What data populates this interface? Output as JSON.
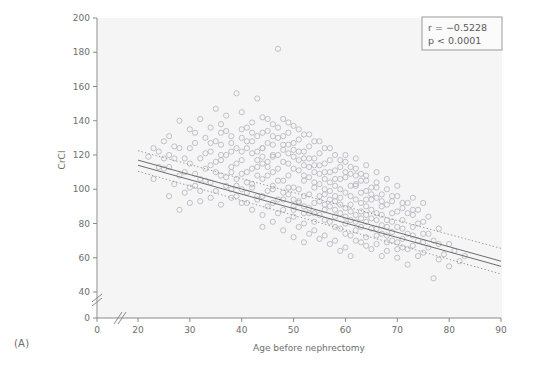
{
  "figure": {
    "panel_label": "(A)",
    "background_color": "#ffffff",
    "plot_background_color": "#f5f5f5",
    "axis_color": "#8a8a8a",
    "marker_color": "#b9b9c4",
    "line_color": "#6d6d6d",
    "band_color": "#9a9a9a"
  },
  "annotations": {
    "r_label": "r = −0.5228",
    "p_label": "p < 0.0001"
  },
  "chart_data": {
    "type": "scatter",
    "title": "",
    "xlabel": "Age before nephrectomy",
    "ylabel": "CrCl",
    "xlim": [
      17,
      90
    ],
    "ylim": [
      0,
      200
    ],
    "x_ticks": [
      0,
      20,
      30,
      40,
      50,
      60,
      70,
      80,
      90
    ],
    "y_ticks": [
      0,
      40,
      60,
      80,
      100,
      120,
      140,
      160,
      180,
      200
    ],
    "x_axis_break": true,
    "y_axis_break": true,
    "grid": false,
    "legend_position": "top-right",
    "correlation_r": -0.5228,
    "p_value": "< 0.0001",
    "regression": {
      "type": "linear",
      "x_start": 20,
      "x_end": 90,
      "y_start": 117.0,
      "y_end": 58.0,
      "second_line_offset": 3.0,
      "confidence_band": {
        "style": "dotted",
        "x_start": 20,
        "x_end": 90,
        "upper_start": 122.5,
        "upper_end": 65.5,
        "lower_start": 110.5,
        "lower_end": 50.5
      }
    },
    "points": [
      [
        22,
        119
      ],
      [
        23,
        106
      ],
      [
        24,
        122
      ],
      [
        25,
        128
      ],
      [
        25,
        112
      ],
      [
        26,
        96
      ],
      [
        26,
        131
      ],
      [
        27,
        118
      ],
      [
        27,
        103
      ],
      [
        28,
        124
      ],
      [
        28,
        140
      ],
      [
        29,
        110
      ],
      [
        29,
        98
      ],
      [
        30,
        135
      ],
      [
        30,
        115
      ],
      [
        30,
        101
      ],
      [
        31,
        127
      ],
      [
        31,
        109
      ],
      [
        32,
        141
      ],
      [
        32,
        118
      ],
      [
        32,
        93
      ],
      [
        33,
        130
      ],
      [
        33,
        112
      ],
      [
        34,
        122
      ],
      [
        34,
        104
      ],
      [
        34,
        136
      ],
      [
        35,
        147
      ],
      [
        35,
        116
      ],
      [
        35,
        99
      ],
      [
        36,
        126
      ],
      [
        36,
        108
      ],
      [
        36,
        138
      ],
      [
        37,
        120
      ],
      [
        37,
        102
      ],
      [
        37,
        143
      ],
      [
        38,
        131
      ],
      [
        38,
        113
      ],
      [
        38,
        95
      ],
      [
        39,
        156
      ],
      [
        39,
        124
      ],
      [
        39,
        106
      ],
      [
        40,
        135
      ],
      [
        40,
        117
      ],
      [
        40,
        100
      ],
      [
        40,
        145
      ],
      [
        41,
        128
      ],
      [
        41,
        110
      ],
      [
        41,
        92
      ],
      [
        42,
        139
      ],
      [
        42,
        121
      ],
      [
        42,
        103
      ],
      [
        43,
        153
      ],
      [
        43,
        131
      ],
      [
        43,
        113
      ],
      [
        43,
        96
      ],
      [
        44,
        124
      ],
      [
        44,
        106
      ],
      [
        44,
        142
      ],
      [
        45,
        134
      ],
      [
        45,
        116
      ],
      [
        45,
        99
      ],
      [
        45,
        127
      ],
      [
        46,
        120
      ],
      [
        46,
        102
      ],
      [
        46,
        138
      ],
      [
        47,
        182
      ],
      [
        47,
        130
      ],
      [
        47,
        112
      ],
      [
        47,
        94
      ],
      [
        48,
        123
      ],
      [
        48,
        105
      ],
      [
        48,
        141
      ],
      [
        49,
        133
      ],
      [
        49,
        115
      ],
      [
        49,
        97
      ],
      [
        49,
        126
      ],
      [
        50,
        119
      ],
      [
        50,
        101
      ],
      [
        50,
        137
      ],
      [
        50,
        88
      ],
      [
        51,
        129
      ],
      [
        51,
        111
      ],
      [
        51,
        93
      ],
      [
        51,
        122
      ],
      [
        52,
        132
      ],
      [
        52,
        114
      ],
      [
        52,
        96
      ],
      [
        52,
        105
      ],
      [
        53,
        125
      ],
      [
        53,
        107
      ],
      [
        53,
        89
      ],
      [
        53,
        118
      ],
      [
        54,
        128
      ],
      [
        54,
        110
      ],
      [
        54,
        92
      ],
      [
        54,
        101
      ],
      [
        55,
        121
      ],
      [
        55,
        103
      ],
      [
        55,
        85
      ],
      [
        55,
        114
      ],
      [
        56,
        124
      ],
      [
        56,
        106
      ],
      [
        56,
        88
      ],
      [
        56,
        97
      ],
      [
        57,
        117
      ],
      [
        57,
        99
      ],
      [
        57,
        81
      ],
      [
        57,
        110
      ],
      [
        58,
        120
      ],
      [
        58,
        102
      ],
      [
        58,
        84
      ],
      [
        58,
        93
      ],
      [
        59,
        113
      ],
      [
        59,
        95
      ],
      [
        59,
        77
      ],
      [
        59,
        106
      ],
      [
        60,
        116
      ],
      [
        60,
        98
      ],
      [
        60,
        80
      ],
      [
        60,
        89
      ],
      [
        60,
        107
      ],
      [
        61,
        109
      ],
      [
        61,
        91
      ],
      [
        61,
        73
      ],
      [
        61,
        102
      ],
      [
        62,
        112
      ],
      [
        62,
        94
      ],
      [
        62,
        76
      ],
      [
        62,
        85
      ],
      [
        62,
        103
      ],
      [
        63,
        105
      ],
      [
        63,
        87
      ],
      [
        63,
        69
      ],
      [
        63,
        98
      ],
      [
        64,
        108
      ],
      [
        64,
        90
      ],
      [
        64,
        72
      ],
      [
        64,
        81
      ],
      [
        64,
        99
      ],
      [
        65,
        101
      ],
      [
        65,
        83
      ],
      [
        65,
        65
      ],
      [
        65,
        94
      ],
      [
        66,
        104
      ],
      [
        66,
        86
      ],
      [
        66,
        68
      ],
      [
        66,
        77
      ],
      [
        67,
        97
      ],
      [
        67,
        79
      ],
      [
        67,
        61
      ],
      [
        67,
        90
      ],
      [
        68,
        100
      ],
      [
        68,
        82
      ],
      [
        68,
        64
      ],
      [
        68,
        73
      ],
      [
        69,
        93
      ],
      [
        69,
        75
      ],
      [
        69,
        86
      ],
      [
        70,
        96
      ],
      [
        70,
        78
      ],
      [
        70,
        60
      ],
      [
        70,
        69
      ],
      [
        71,
        89
      ],
      [
        71,
        71
      ],
      [
        71,
        82
      ],
      [
        72,
        92
      ],
      [
        72,
        74
      ],
      [
        72,
        56
      ],
      [
        72,
        65
      ],
      [
        73,
        85
      ],
      [
        73,
        67
      ],
      [
        73,
        78
      ],
      [
        74,
        88
      ],
      [
        74,
        70
      ],
      [
        74,
        61
      ],
      [
        75,
        81
      ],
      [
        75,
        63
      ],
      [
        75,
        74
      ],
      [
        76,
        84
      ],
      [
        76,
        66
      ],
      [
        77,
        48
      ],
      [
        77,
        70
      ],
      [
        78,
        77
      ],
      [
        78,
        59
      ],
      [
        79,
        62
      ],
      [
        80,
        68
      ],
      [
        80,
        55
      ],
      [
        81,
        64
      ],
      [
        82,
        58
      ],
      [
        83,
        61
      ],
      [
        24,
        113
      ],
      [
        26,
        120
      ],
      [
        28,
        108
      ],
      [
        31,
        133
      ],
      [
        33,
        121
      ],
      [
        35,
        128
      ],
      [
        37,
        134
      ],
      [
        39,
        115
      ],
      [
        41,
        136
      ],
      [
        43,
        122
      ],
      [
        45,
        108
      ],
      [
        47,
        120
      ],
      [
        49,
        108
      ],
      [
        51,
        100
      ],
      [
        53,
        97
      ],
      [
        55,
        93
      ],
      [
        57,
        90
      ],
      [
        59,
        86
      ],
      [
        61,
        82
      ],
      [
        63,
        78
      ],
      [
        30,
        124
      ],
      [
        32,
        106
      ],
      [
        34,
        114
      ],
      [
        36,
        117
      ],
      [
        38,
        122
      ],
      [
        40,
        109
      ],
      [
        42,
        112
      ],
      [
        44,
        115
      ],
      [
        46,
        110
      ],
      [
        48,
        98
      ],
      [
        50,
        94
      ],
      [
        52,
        90
      ],
      [
        54,
        86
      ],
      [
        56,
        82
      ],
      [
        58,
        78
      ],
      [
        60,
        74
      ],
      [
        62,
        70
      ],
      [
        64,
        67
      ],
      [
        66,
        95
      ],
      [
        68,
        91
      ],
      [
        70,
        87
      ],
      [
        42,
        128
      ],
      [
        44,
        96
      ],
      [
        46,
        92
      ],
      [
        48,
        88
      ],
      [
        50,
        84
      ],
      [
        52,
        80
      ],
      [
        54,
        76
      ],
      [
        56,
        73
      ],
      [
        58,
        70
      ],
      [
        60,
        66
      ],
      [
        44,
        133
      ],
      [
        46,
        126
      ],
      [
        48,
        131
      ],
      [
        50,
        127
      ],
      [
        52,
        122
      ],
      [
        54,
        118
      ],
      [
        56,
        115
      ],
      [
        58,
        111
      ],
      [
        60,
        120
      ],
      [
        62,
        118
      ],
      [
        64,
        114
      ],
      [
        66,
        110
      ],
      [
        38,
        100
      ],
      [
        40,
        92
      ],
      [
        42,
        88
      ],
      [
        44,
        85
      ],
      [
        36,
        91
      ],
      [
        34,
        95
      ],
      [
        32,
        99
      ],
      [
        30,
        92
      ],
      [
        28,
        88
      ],
      [
        26,
        113
      ],
      [
        66,
        101
      ],
      [
        68,
        106
      ],
      [
        70,
        102
      ],
      [
        64,
        105
      ],
      [
        62,
        108
      ],
      [
        59,
        117
      ],
      [
        61,
        113
      ],
      [
        63,
        109
      ],
      [
        57,
        124
      ],
      [
        55,
        128
      ],
      [
        53,
        132
      ],
      [
        51,
        135
      ],
      [
        49,
        139
      ],
      [
        47,
        136
      ],
      [
        45,
        141
      ],
      [
        52,
        108
      ],
      [
        54,
        104
      ],
      [
        56,
        100
      ],
      [
        58,
        96
      ],
      [
        50,
        112
      ],
      [
        48,
        116
      ],
      [
        46,
        119
      ],
      [
        44,
        124
      ],
      [
        65,
        77
      ],
      [
        67,
        85
      ],
      [
        69,
        81
      ],
      [
        71,
        77
      ],
      [
        73,
        73
      ],
      [
        75,
        69
      ],
      [
        59,
        64
      ],
      [
        61,
        61
      ],
      [
        57,
        68
      ],
      [
        55,
        71
      ],
      [
        53,
        74
      ],
      [
        51,
        78
      ],
      [
        49,
        82
      ],
      [
        47,
        86
      ],
      [
        45,
        90
      ],
      [
        43,
        94
      ],
      [
        41,
        98
      ],
      [
        39,
        102
      ],
      [
        37,
        107
      ],
      [
        35,
        110
      ],
      [
        33,
        105
      ],
      [
        31,
        102
      ],
      [
        29,
        118
      ],
      [
        27,
        125
      ],
      [
        25,
        118
      ],
      [
        23,
        124
      ],
      [
        63,
        92
      ],
      [
        65,
        88
      ],
      [
        67,
        93
      ],
      [
        69,
        96
      ],
      [
        71,
        92
      ],
      [
        73,
        88
      ],
      [
        61,
        96
      ],
      [
        59,
        100
      ],
      [
        57,
        104
      ],
      [
        55,
        109
      ],
      [
        53,
        113
      ],
      [
        51,
        117
      ],
      [
        49,
        121
      ],
      [
        43,
        108
      ],
      [
        41,
        104
      ],
      [
        39,
        96
      ],
      [
        42,
        101
      ],
      [
        40,
        122
      ],
      [
        38,
        127
      ],
      [
        36,
        133
      ],
      [
        34,
        127
      ],
      [
        46,
        100
      ],
      [
        48,
        94
      ],
      [
        50,
        90
      ],
      [
        52,
        86
      ],
      [
        54,
        81
      ],
      [
        56,
        91
      ],
      [
        58,
        88
      ],
      [
        60,
        84
      ],
      [
        62,
        81
      ],
      [
        64,
        94
      ],
      [
        66,
        73
      ],
      [
        68,
        69
      ],
      [
        70,
        65
      ],
      [
        72,
        86
      ],
      [
        74,
        80
      ],
      [
        76,
        74
      ],
      [
        78,
        68
      ],
      [
        44,
        78
      ],
      [
        46,
        81
      ],
      [
        48,
        76
      ],
      [
        50,
        72
      ],
      [
        52,
        69
      ],
      [
        47,
        105
      ],
      [
        45,
        113
      ],
      [
        43,
        117
      ],
      [
        41,
        124
      ],
      [
        49,
        101
      ],
      [
        51,
        92
      ],
      [
        53,
        86
      ],
      [
        55,
        96
      ],
      [
        57,
        94
      ],
      [
        59,
        91
      ],
      [
        61,
        87
      ],
      [
        63,
        83
      ],
      [
        65,
        97
      ],
      [
        67,
        74
      ],
      [
        69,
        70
      ],
      [
        71,
        66
      ],
      [
        73,
        95
      ],
      [
        75,
        92
      ],
      [
        36,
        120
      ],
      [
        38,
        110
      ],
      [
        40,
        130
      ],
      [
        42,
        133
      ],
      [
        60,
        110
      ],
      [
        62,
        102
      ],
      [
        64,
        85
      ],
      [
        66,
        82
      ],
      [
        68,
        78
      ],
      [
        58,
        106
      ],
      [
        56,
        110
      ],
      [
        54,
        114
      ],
      [
        52,
        118
      ],
      [
        50,
        123
      ],
      [
        48,
        126
      ],
      [
        44,
        119
      ],
      [
        46,
        131
      ]
    ]
  }
}
